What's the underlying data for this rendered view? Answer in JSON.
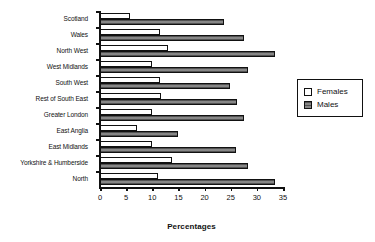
{
  "chart_data": {
    "type": "bar",
    "orientation": "horizontal",
    "title": "",
    "xlabel": "Percentages",
    "ylabel": "",
    "xlim": [
      0,
      35
    ],
    "xticks": [
      0,
      5,
      10,
      15,
      20,
      25,
      30,
      35
    ],
    "xtick_labels": [
      "0",
      "5",
      "10",
      "15",
      "20",
      "25",
      "30",
      "35"
    ],
    "grid": false,
    "legend_position": "right",
    "categories": [
      "Scotland",
      "Wales",
      "North West",
      "West Midlands",
      "South West",
      "Rest of South East",
      "Greater London",
      "East Anglia",
      "East Midlands",
      "Yorkshire & Humberside",
      "North"
    ],
    "series": [
      {
        "name": "Females",
        "color": "#ffffff",
        "values": [
          5.8,
          11.5,
          13.0,
          10.0,
          11.5,
          11.7,
          10.0,
          7.0,
          10.0,
          13.8,
          11.0
        ]
      },
      {
        "name": "Males",
        "color": "#767676",
        "values": [
          23.7,
          27.5,
          33.5,
          28.3,
          24.8,
          26.2,
          27.6,
          15.0,
          26.1,
          28.4,
          33.5
        ]
      }
    ]
  },
  "legend": {
    "items": [
      {
        "label": "Females",
        "swatch": "females"
      },
      {
        "label": "Males",
        "swatch": "males"
      }
    ]
  }
}
